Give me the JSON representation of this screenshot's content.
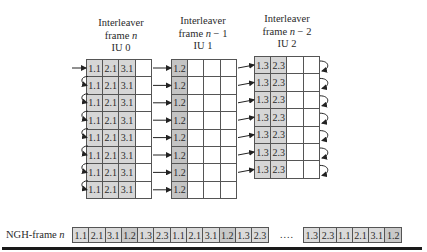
{
  "blocks": [
    {
      "title_line1": "Interleaver",
      "title_line2_prefix": "frame ",
      "title_var": "n",
      "title_line2_suffix": "",
      "title_line3": "IU 0"
    },
    {
      "title_line1": "Interleaver",
      "title_line2_prefix": "frame ",
      "title_var": "n",
      "title_line2_suffix": " − 1",
      "title_line3": "IU 1"
    },
    {
      "title_line1": "Interleaver",
      "title_line2_prefix": "frame ",
      "title_var": "n",
      "title_line2_suffix": " − 2",
      "title_line3": "IU 2"
    }
  ],
  "iu0": {
    "rows": 8,
    "cells": [
      "1.1",
      "2.1",
      "3.1",
      ""
    ]
  },
  "iu1": {
    "rows": 8,
    "cells": [
      "1.2",
      "",
      "",
      ""
    ]
  },
  "iu2": {
    "rows": 7,
    "cells": [
      "1.3",
      "2.3",
      "",
      ""
    ]
  },
  "ngh": {
    "label_prefix": "NGH-frame ",
    "label_var": "n",
    "group1": [
      "1.1",
      "2.1",
      "3.1",
      "1.2",
      "1.3",
      "2.3",
      "1.1",
      "2.1",
      "3.1",
      "1.2",
      "1.3",
      "2.3"
    ],
    "ellipsis": "....",
    "group2": [
      "1.3",
      "2.3",
      "1.1",
      "2.1",
      "3.1",
      "1.2"
    ]
  }
}
